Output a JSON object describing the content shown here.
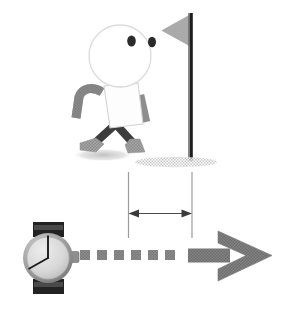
{
  "figure": {
    "caption_text": "",
    "background_color": "#ffffff"
  },
  "colors": {
    "outline": "#d8d8d8",
    "head_fill": "#ffffff",
    "torso_fill": "#fbfbfb",
    "arm_gray": "#8a8a8a",
    "leg_dark": "#3a3a3a",
    "shoe_gray": "#9e9e9e",
    "eye_dark": "#2b2b2b",
    "flag_gray": "#a8a8a8",
    "pole_dark": "#222222",
    "ground_hatch": "#cfcfcf",
    "shadow_gray": "#c9c9c9",
    "dimension_line": "#4a4a4a",
    "extension_line": "#9a9a9a",
    "arrow_gray": "#7c7c7c",
    "dash_gray": "#8e8e8e",
    "watch_band": "#2a2a2a",
    "watch_case": "#9a9a9a",
    "watch_face": "#d9d9d9",
    "watch_hand": "#1c1c1c"
  },
  "walker": {
    "label": "walking-stick-figure",
    "head": {
      "cx": 120,
      "cy": 56,
      "rx": 31,
      "ry": 31
    },
    "eyes": [
      {
        "cx": 131,
        "cy": 41,
        "rx": 4.2,
        "ry": 5.4
      },
      {
        "cx": 152,
        "cy": 42,
        "rx": 4.0,
        "ry": 5.2
      }
    ],
    "shadow": {
      "cx": 103,
      "cy": 155,
      "rx": 31,
      "ry": 6
    }
  },
  "flag": {
    "label": "flag-marker",
    "pole_x": 192,
    "pole_top": 13,
    "pole_bottom": 161,
    "banner_points": "190,15 190,45 163,30",
    "ground": {
      "cx": 176,
      "cy": 162,
      "rx": 40,
      "ry": 5
    }
  },
  "dimension": {
    "label": "distance-measurement",
    "left_x": 128,
    "right_x": 192,
    "top_y": 172,
    "bottom_y": 238,
    "arrow_y": 213,
    "value_text": ""
  },
  "timeline": {
    "label": "time-arrow",
    "dash_count": 6,
    "dash_size": 9,
    "dash_start_x": 80,
    "dash_gap": 17,
    "dash_y": 254,
    "shaft": {
      "x": 190,
      "y": 250,
      "width": 48,
      "height": 17
    },
    "head_points": "222,232 272,258.5 222,285 222,272 248,258.5 222,245"
  },
  "watch": {
    "label": "wristwatch-clock",
    "center": {
      "cx": 48,
      "cy": 258
    },
    "case_radius": 25,
    "face_radius": 21,
    "band_top": {
      "x": 33,
      "y": 223,
      "width": 31,
      "height": 14
    },
    "band_bottom": {
      "x": 33,
      "y": 279,
      "width": 31,
      "height": 14
    },
    "crown": {
      "x": 72,
      "y": 252,
      "width": 8,
      "height": 11
    },
    "time_display": "12:40",
    "minute_hand": {
      "x2": 48,
      "y2": 235
    },
    "hour_hand": {
      "x2": 29,
      "y2": 269
    }
  }
}
